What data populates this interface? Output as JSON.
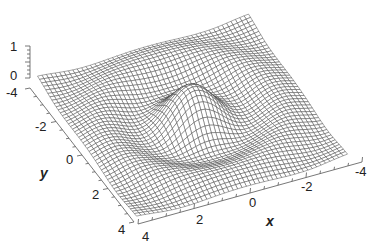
{
  "chart_data": {
    "type": "surface3d",
    "title": "",
    "function": "z = sin(r)/r, r = sqrt(x^2+y^2) scaled (radial sinc ripple)",
    "xlabel": "x",
    "ylabel": "y",
    "zlabel": "",
    "xlim": [
      -4,
      4
    ],
    "ylim": [
      -4,
      4
    ],
    "zlim": [
      0,
      1
    ],
    "x_ticks": [
      "4",
      "2",
      "0",
      "-2",
      "-4"
    ],
    "y_ticks": [
      "-4",
      "-2",
      "0",
      "2",
      "4"
    ],
    "z_ticks": [
      "1",
      "0"
    ],
    "grid_resolution": 48,
    "style": "wireframe mesh, hidden surfaces removed",
    "colors": {
      "mesh": "#3a3a3a",
      "background": "#ffffff",
      "axis": "#555555"
    }
  },
  "axes": {
    "z_ticks": [
      {
        "label": "1",
        "x": 10,
        "y": 51
      },
      {
        "label": "0",
        "x": 10,
        "y": 80
      }
    ],
    "y_ticks": [
      {
        "label": "-4",
        "x": 10,
        "y": 97
      },
      {
        "label": "-2",
        "x": 36,
        "y": 131
      },
      {
        "label": "0",
        "x": 64,
        "y": 164
      },
      {
        "label": "2",
        "x": 90,
        "y": 199
      },
      {
        "label": "4",
        "x": 117,
        "y": 234
      }
    ],
    "x_ticks": [
      {
        "label": "4",
        "x": 142,
        "y": 238
      },
      {
        "label": "2",
        "x": 196,
        "y": 222
      },
      {
        "label": "0",
        "x": 250,
        "y": 207
      },
      {
        "label": "-2",
        "x": 300,
        "y": 191
      },
      {
        "label": "-4",
        "x": 352,
        "y": 176
      }
    ],
    "x_title": {
      "label": "x",
      "x": 266,
      "y": 226
    },
    "y_title": {
      "label": "y",
      "x": 42,
      "y": 176
    }
  }
}
